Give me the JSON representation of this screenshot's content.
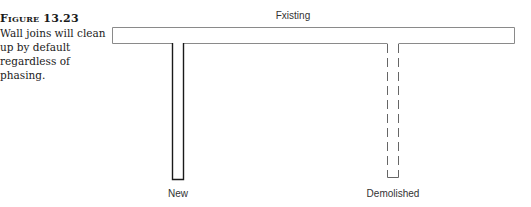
{
  "figure": {
    "number": "Figure 13.23",
    "caption": "Wall joins will clean up by default regardless of phasing."
  },
  "diagram": {
    "labels": {
      "existing": "Fxisting",
      "new": "New",
      "demolished": "Demolished"
    },
    "colors": {
      "existing_stroke": "#8a8a8a",
      "new_stroke": "#1a1a1a",
      "demolished_stroke": "#666666"
    }
  }
}
